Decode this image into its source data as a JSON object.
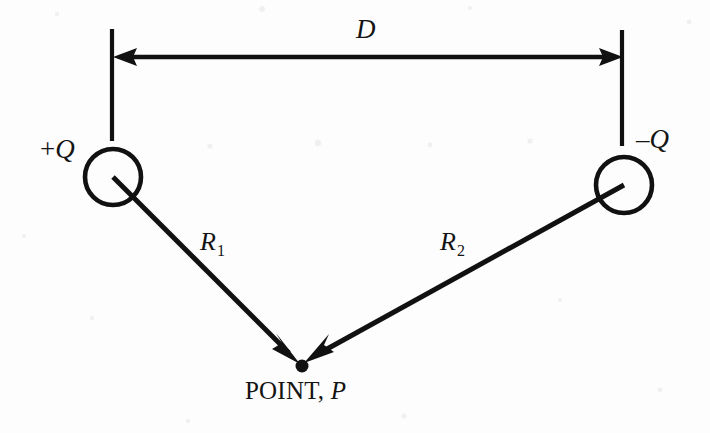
{
  "figure": {
    "background_color": "#fdfdfd",
    "ink_color": "#111111"
  },
  "labels": {
    "charge_left": {
      "sign": "+",
      "symbol": "Q",
      "full": "+Q"
    },
    "charge_right": {
      "sign": "–",
      "symbol": "Q",
      "full": "–Q"
    },
    "separation": "D",
    "distance_1": {
      "base": "R",
      "sub": "1",
      "full": "R1"
    },
    "distance_2": {
      "base": "R",
      "sub": "2",
      "full": "R2"
    },
    "point": {
      "text": "POINT,",
      "symbol": "P",
      "full": "POINT, P"
    }
  },
  "geometry": {
    "canvas": {
      "width": 710,
      "height": 433
    },
    "charge_left_circle": {
      "cx": 113,
      "cy": 177,
      "r": 28
    },
    "charge_right_circle": {
      "cx": 624,
      "cy": 185,
      "r": 28
    },
    "point_p": {
      "cx": 302,
      "cy": 366,
      "r": 6
    },
    "dimension_line": {
      "x1": 113,
      "x2": 623,
      "y": 57
    },
    "tick_left": {
      "x": 112,
      "y1": 29,
      "y2": 141
    },
    "tick_right": {
      "x": 622,
      "y1": 30,
      "y2": 146
    },
    "ray_r1": {
      "x1": 113,
      "y1": 177,
      "x2": 302,
      "y2": 366
    },
    "ray_r2": {
      "x1": 624,
      "y1": 185,
      "x2": 302,
      "y2": 366
    }
  },
  "label_positions": {
    "charge_left": {
      "left": 40,
      "top": 136
    },
    "charge_right": {
      "left": 636,
      "top": 126
    },
    "separation": {
      "left": 356,
      "top": 16
    },
    "distance_1": {
      "left": 200,
      "top": 229
    },
    "distance_2": {
      "left": 440,
      "top": 229
    },
    "point": {
      "left": 245,
      "top": 378
    }
  }
}
